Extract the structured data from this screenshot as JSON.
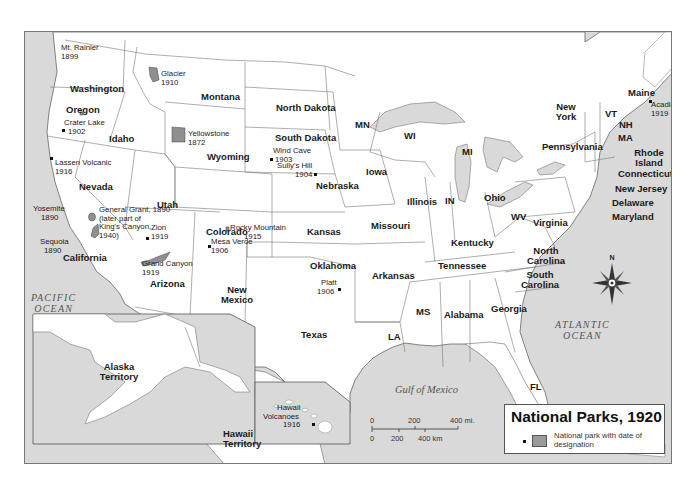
{
  "map": {
    "title": "National Parks, 1920",
    "legend": {
      "title": "National Parks, 1920",
      "symbol_point": "small-black-square",
      "symbol_area": "gray-rectangle",
      "description": "National park with date of designation"
    },
    "compass": {
      "label": "N"
    },
    "scale_bar": {
      "miles": {
        "labels": [
          "0",
          "200",
          "400 mi."
        ]
      },
      "km": {
        "labels": [
          "0",
          "200",
          "400 km"
        ]
      }
    },
    "water_bodies": {
      "pacific": [
        "PACIFIC",
        "OCEAN"
      ],
      "atlantic": [
        "ATLANTIC",
        "OCEAN"
      ],
      "gulf": "Gulf of Mexico"
    },
    "states": [
      {
        "name": "Washington"
      },
      {
        "name": "Oregon"
      },
      {
        "name": "California"
      },
      {
        "name": "Idaho"
      },
      {
        "name": "Nevada"
      },
      {
        "name": "Utah"
      },
      {
        "name": "Arizona"
      },
      {
        "name": "Montana"
      },
      {
        "name": "Wyoming"
      },
      {
        "name": "Colorado"
      },
      {
        "name": "New Mexico"
      },
      {
        "name": "North Dakota"
      },
      {
        "name": "South Dakota"
      },
      {
        "name": "Nebraska"
      },
      {
        "name": "Kansas"
      },
      {
        "name": "Oklahoma"
      },
      {
        "name": "Texas"
      },
      {
        "name": "MN"
      },
      {
        "name": "Iowa"
      },
      {
        "name": "Missouri"
      },
      {
        "name": "Arkansas"
      },
      {
        "name": "LA"
      },
      {
        "name": "WI"
      },
      {
        "name": "Illinois"
      },
      {
        "name": "MS"
      },
      {
        "name": "MI"
      },
      {
        "name": "IN"
      },
      {
        "name": "Kentucky"
      },
      {
        "name": "Tennessee"
      },
      {
        "name": "Alabama"
      },
      {
        "name": "Ohio"
      },
      {
        "name": "Georgia"
      },
      {
        "name": "FL"
      },
      {
        "name": "WV"
      },
      {
        "name": "Virginia"
      },
      {
        "name": "North Carolina"
      },
      {
        "name": "South Carolina"
      },
      {
        "name": "Pennsylvania"
      },
      {
        "name": "New York"
      },
      {
        "name": "VT"
      },
      {
        "name": "NH"
      },
      {
        "name": "MA"
      },
      {
        "name": "Maine"
      },
      {
        "name": "Rhode Island"
      },
      {
        "name": "Connecticut"
      },
      {
        "name": "New Jersey"
      },
      {
        "name": "Delaware"
      },
      {
        "name": "Maryland"
      },
      {
        "name": "Alaska Territory"
      },
      {
        "name": "Hawaii Territory"
      }
    ],
    "parks": [
      {
        "name": "Mt. Rainier",
        "year": "1899"
      },
      {
        "name": "Crater Lake",
        "year": "1902"
      },
      {
        "name": "Lassen Volcanic",
        "year": "1916"
      },
      {
        "name": "Yosemite",
        "year": "1890"
      },
      {
        "name": "General Grant, 1890 (later part of King's Canyon, 1940)",
        "year": "1890"
      },
      {
        "name": "Sequoia",
        "year": "1890"
      },
      {
        "name": "Glacier",
        "year": "1910"
      },
      {
        "name": "Yellowstone",
        "year": "1872"
      },
      {
        "name": "Zion",
        "year": "1919"
      },
      {
        "name": "Grand Canyon",
        "year": "1919"
      },
      {
        "name": "Rocky Mountain",
        "year": "1915"
      },
      {
        "name": "Mesa Verde",
        "year": "1906"
      },
      {
        "name": "Sully's Hill",
        "year": "1904"
      },
      {
        "name": "Wind Cave",
        "year": "1903"
      },
      {
        "name": "Platt",
        "year": "1906"
      },
      {
        "name": "Acadia",
        "year": "1919"
      },
      {
        "name": "Hawaii Volcanoes",
        "year": "1916"
      }
    ],
    "labels": {
      "general_grant_lines": [
        "General Grant, 1890",
        "(later part of",
        "King's Canyon,",
        "1940)"
      ],
      "hawaii_volcanoes_lines": [
        "Hawaii",
        "Volcanoes"
      ],
      "new_mexico_lines": [
        "New",
        "Mexico"
      ],
      "north_carolina_lines": [
        "North",
        "Carolina"
      ],
      "south_carolina_lines": [
        "South",
        "Carolina"
      ],
      "new_york_lines": [
        "New",
        "York"
      ],
      "rhode_island_lines": [
        "Rhode",
        "Island"
      ],
      "alaska_lines": [
        "Alaska",
        "Territory"
      ],
      "hawaii_lines": [
        "Hawaii",
        "Territory"
      ]
    }
  }
}
